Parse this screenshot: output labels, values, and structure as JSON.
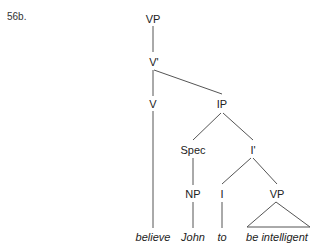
{
  "example_label": "56b.",
  "tree": {
    "nodes": {
      "vp_root": "VP",
      "v_bar": "V'",
      "v": "V",
      "ip": "IP",
      "spec": "Spec",
      "i_bar": "I'",
      "np": "NP",
      "i": "I",
      "vp_lower": "VP"
    },
    "words": {
      "believe": "believe",
      "john": "John",
      "to": "to",
      "be_intelligent": "be intelligent"
    }
  }
}
